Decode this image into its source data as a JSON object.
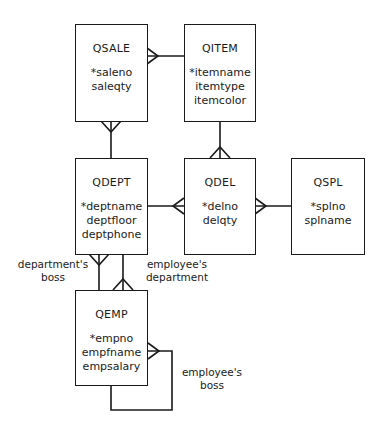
{
  "entities": {
    "qsale": {
      "name": "QSALE",
      "attributes": [
        "*saleno",
        "saleqty"
      ]
    },
    "qitem": {
      "name": "QITEM",
      "attributes": [
        "*itemname",
        "itemtype",
        "itemcolor"
      ]
    },
    "qdept": {
      "name": "QDEPT",
      "attributes": [
        "*deptname",
        "deptfloor",
        "deptphone"
      ]
    },
    "qdel": {
      "name": "QDEL",
      "attributes": [
        "*delno",
        "delqty"
      ]
    },
    "qspl": {
      "name": "QSPL",
      "attributes": [
        "*splno",
        "splname"
      ]
    },
    "qemp": {
      "name": "QEMP",
      "attributes": [
        "*empno",
        "empfname",
        "empsalary"
      ]
    }
  },
  "relationships": {
    "departments_boss": {
      "line1": "department's",
      "line2": "boss"
    },
    "employees_department": {
      "line1": "employee's",
      "line2": "department"
    },
    "employees_boss": {
      "line1": "employee's",
      "line2": "boss"
    }
  },
  "colors": {
    "line": "#1a1a1a",
    "background": "#ffffff"
  }
}
